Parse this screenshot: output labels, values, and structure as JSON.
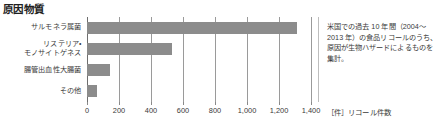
{
  "chart_data": {
    "type": "bar",
    "orientation": "horizontal",
    "title": "原因物質",
    "categories": [
      "サルモネラ属菌",
      "リステリア・\nモノサイトゲネス",
      "腸管出血性大腸菌",
      "その他"
    ],
    "values": [
      1310,
      530,
      145,
      60
    ],
    "xlabel": "［件］リコール件数",
    "ylabel": "",
    "xlim": [
      0,
      1400
    ],
    "xticks": [
      0,
      200,
      400,
      600,
      800,
      1000,
      1200,
      1400
    ],
    "xtick_labels": [
      "0",
      "200",
      "400",
      "600",
      "800",
      "1,000",
      "1,200",
      "1,400"
    ],
    "grid": true,
    "legend": false,
    "bar_color": "#8c8c8c",
    "gridline_color": "#9a9a9a"
  },
  "note": {
    "lines": [
      "米国での過去 10 年間（2004〜",
      "2013 年）の食品リコールのうち、",
      "原因が生物ハザードによるものを",
      "集計。"
    ]
  }
}
